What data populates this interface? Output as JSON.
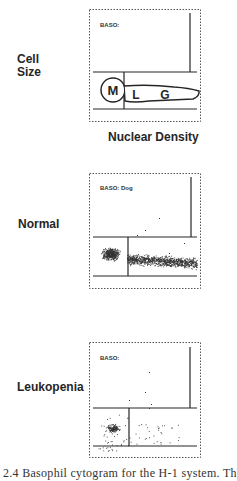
{
  "figure": {
    "row_labels": {
      "cell_size": "Cell\nSize",
      "cell_size_line1": "Cell",
      "cell_size_line2": "Size",
      "normal": "Normal",
      "leukopenia": "Leukopenia"
    },
    "x_axis_label": "Nuclear Density",
    "caption_partial": "e 2.4 Basophil cytogram for the H-1 system. Th",
    "panels": [
      {
        "title": "BASO:",
        "type": "schematic",
        "regions": [
          "M",
          "L",
          "G"
        ]
      },
      {
        "title": "BASO: Dog",
        "type": "scatter",
        "description": "Dense cluster in lower-left (mononuclear) region continuing as band to the right (L/G)"
      },
      {
        "title": "BASO:",
        "type": "scatter",
        "description": "Sparse points; small cluster in lower-left region, scattered points on the right"
      }
    ]
  },
  "colors": {
    "ink": "#262626",
    "frame": "#555555",
    "dots": "#333333",
    "background": "#ffffff"
  }
}
